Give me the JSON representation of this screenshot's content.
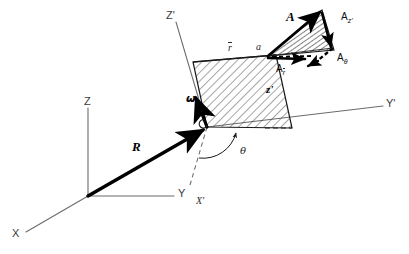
{
  "figure": {
    "background_color": "#ffffff",
    "ink_color": "#1a1a1a",
    "width": 409,
    "height": 254
  },
  "axes": {
    "inertial": {
      "z_label": "Z",
      "y_label": "Y",
      "x_label": "X",
      "origin_name": "O"
    },
    "rotating": {
      "z_prime_label": "Z'",
      "y_prime_label": "Y'",
      "x_prime_label": "X'",
      "z_local_label": "z'"
    }
  },
  "vectors": {
    "position_R": "R",
    "angular_velocity": "ω",
    "acceleration": "A",
    "components": [
      {
        "name": "A_z",
        "label": "A",
        "subscript": "z'"
      },
      {
        "name": "A_theta",
        "label": "A",
        "subscript": "θ"
      },
      {
        "name": "A_r",
        "label": "A",
        "subscript": "r"
      }
    ]
  },
  "points": {
    "r_bar": "r",
    "a_point": "a"
  },
  "angles": {
    "theta": "θ"
  },
  "plane": {
    "hatch_color": "#2a2a2a",
    "edge_color": "#1a1a1a",
    "name": "rotating-plane-parallelogram"
  }
}
